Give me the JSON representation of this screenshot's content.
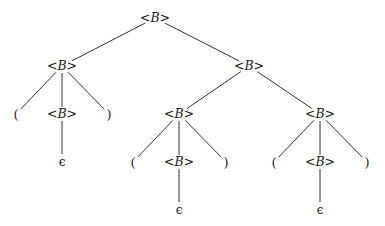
{
  "diagram": {
    "type": "parse-tree",
    "nonterminal_label": "B",
    "nodes": [
      {
        "id": "n0",
        "kind": "nonterminal",
        "label": "B",
        "x": 155,
        "y": 18
      },
      {
        "id": "n1",
        "kind": "nonterminal",
        "label": "B",
        "x": 62,
        "y": 66
      },
      {
        "id": "n2",
        "kind": "nonterminal",
        "label": "B",
        "x": 249,
        "y": 66
      },
      {
        "id": "n3",
        "kind": "terminal",
        "label": "(",
        "x": 16,
        "y": 114
      },
      {
        "id": "n4",
        "kind": "nonterminal",
        "label": "B",
        "x": 62,
        "y": 114
      },
      {
        "id": "n5",
        "kind": "terminal",
        "label": ")",
        "x": 109,
        "y": 114
      },
      {
        "id": "n6",
        "kind": "epsilon",
        "label": "ϵ",
        "x": 62,
        "y": 162
      },
      {
        "id": "n7",
        "kind": "nonterminal",
        "label": "B",
        "x": 179,
        "y": 114
      },
      {
        "id": "n8",
        "kind": "nonterminal",
        "label": "B",
        "x": 320,
        "y": 114
      },
      {
        "id": "n9",
        "kind": "terminal",
        "label": "(",
        "x": 133,
        "y": 162
      },
      {
        "id": "n10",
        "kind": "nonterminal",
        "label": "B",
        "x": 179,
        "y": 162
      },
      {
        "id": "n11",
        "kind": "terminal",
        "label": ")",
        "x": 226,
        "y": 162
      },
      {
        "id": "n12",
        "kind": "epsilon",
        "label": "ϵ",
        "x": 179,
        "y": 210
      },
      {
        "id": "n13",
        "kind": "terminal",
        "label": "(",
        "x": 274,
        "y": 162
      },
      {
        "id": "n14",
        "kind": "nonterminal",
        "label": "B",
        "x": 320,
        "y": 162
      },
      {
        "id": "n15",
        "kind": "terminal",
        "label": ")",
        "x": 367,
        "y": 162
      },
      {
        "id": "n16",
        "kind": "epsilon",
        "label": "ϵ",
        "x": 320,
        "y": 210
      }
    ],
    "edges": [
      [
        "n0",
        "n1"
      ],
      [
        "n0",
        "n2"
      ],
      [
        "n1",
        "n3"
      ],
      [
        "n1",
        "n4"
      ],
      [
        "n1",
        "n5"
      ],
      [
        "n4",
        "n6"
      ],
      [
        "n2",
        "n7"
      ],
      [
        "n2",
        "n8"
      ],
      [
        "n7",
        "n9"
      ],
      [
        "n7",
        "n10"
      ],
      [
        "n7",
        "n11"
      ],
      [
        "n10",
        "n12"
      ],
      [
        "n8",
        "n13"
      ],
      [
        "n8",
        "n14"
      ],
      [
        "n8",
        "n15"
      ],
      [
        "n14",
        "n16"
      ]
    ],
    "line_color": "#333333"
  }
}
